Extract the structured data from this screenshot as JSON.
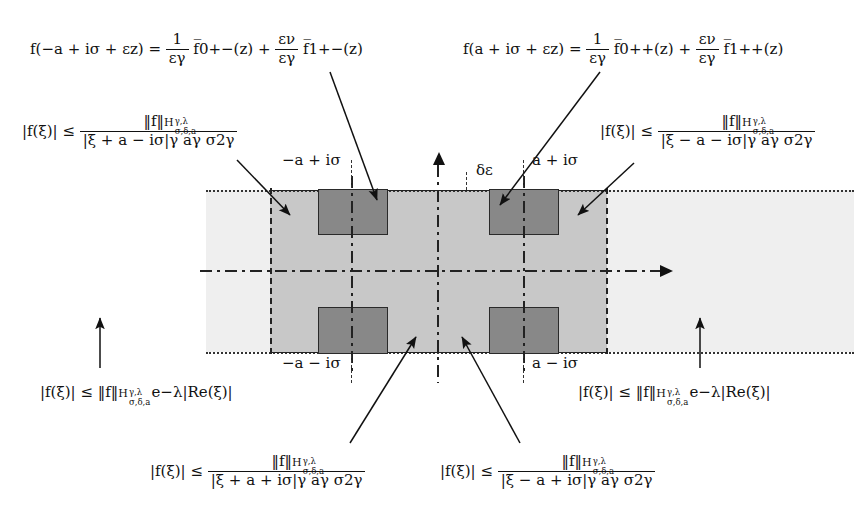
{
  "figure": {
    "kind": "complex-plane-strip-diagram",
    "colors": {
      "outer_strip": "#efefef",
      "inner_strip": "#c8c8c8",
      "block": "#888888",
      "ink": "#1a1a1a"
    }
  },
  "formulas": {
    "expansion_left": {
      "lhs": "f(−a + iσ + εz) =",
      "term1_num": "1",
      "term1_den": "εγ",
      "term1_fn": "f̅0+−(z)",
      "plus": "+",
      "term2_num": "εν",
      "term2_den": "εγ",
      "term2_fn": "f̅1+−(z)"
    },
    "expansion_right": {
      "lhs": "f(a + iσ + εz) =",
      "term1_num": "1",
      "term1_den": "εγ",
      "term1_fn": "f̅0++(z)",
      "plus": "+",
      "term2_num": "εν",
      "term2_den": "εγ",
      "term2_fn": "f̅1++(z)"
    },
    "bound_top_left": {
      "lhs": "|f(ξ)| ≤",
      "den": "|ξ + a − iσ|γ aγ σ2γ"
    },
    "bound_top_right": {
      "lhs": "|f(ξ)| ≤",
      "den": "|ξ − a − iσ|γ aγ σ2γ"
    },
    "bound_bottom_left": {
      "lhs": "|f(ξ)| ≤",
      "den": "|ξ + a + iσ|γ aγ σ2γ"
    },
    "bound_bottom_right": {
      "lhs": "|f(ξ)| ≤",
      "den": "|ξ − a + iσ|γ aγ σ2γ"
    },
    "decay_left": {
      "lhs": "|f(ξ)| ≤",
      "norm": "‖f‖",
      "exp": "e−λ|Re(ξ)|"
    },
    "decay_right": {
      "lhs": "|f(ξ)| ≤",
      "norm": "‖f‖",
      "exp": "e−λ|Re(ξ)|"
    },
    "norm_symbol": "‖f‖",
    "norm_space_base": "H",
    "norm_space_sup": "γ,λ",
    "norm_space_sub": "σ,δ,a"
  },
  "labels": {
    "top_left_point": "−a + iσ",
    "top_right_point": "a + iσ",
    "bottom_left_point": "−a − iσ",
    "bottom_right_point": "a − iσ",
    "delta_epsilon": "δε"
  }
}
